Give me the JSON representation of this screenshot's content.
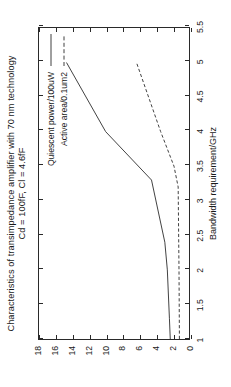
{
  "chart_data": {
    "type": "line",
    "title": "Characteristics of transimpedance amplifier with 70 nm technology",
    "subtitle": "Cd = 100fF, Cl = 4.6fF",
    "xlabel": "Bandwidth requirement/GHz",
    "ylabel": "",
    "xlim": [
      1,
      5.5
    ],
    "ylim": [
      0,
      18
    ],
    "xticks": [
      "1",
      "1.5",
      "2",
      "2.5",
      "3",
      "3.5",
      "4",
      "4.5",
      "5",
      "5.5"
    ],
    "xtick_values": [
      1,
      1.5,
      2,
      2.5,
      3,
      3.5,
      4,
      4.5,
      5,
      5.5
    ],
    "yticks": [
      "0",
      "2",
      "4",
      "6",
      "8",
      "10",
      "12",
      "14",
      "16",
      "18"
    ],
    "ytick_values": [
      0,
      2,
      4,
      6,
      8,
      10,
      12,
      14,
      16,
      18
    ],
    "grid": false,
    "legend_position": "top-right-inside",
    "series": [
      {
        "name": "Quiescent power/100uW",
        "style": "solid",
        "color": "#404040",
        "x": [
          1.0,
          1.3,
          2.0,
          2.4,
          3.3,
          4.0,
          5.0
        ],
        "y": [
          2.25,
          2.35,
          2.6,
          2.9,
          4.5,
          10.0,
          14.7
        ]
      },
      {
        "name": "Active area/0.1um2",
        "style": "dashed",
        "color": "#404040",
        "x": [
          1.0,
          2.0,
          3.2,
          3.5,
          4.0,
          5.0
        ],
        "y": [
          1.15,
          1.2,
          1.3,
          1.8,
          3.4,
          6.3
        ]
      }
    ]
  },
  "legend": {
    "entries": [
      {
        "label": "Quiescent power/100uW",
        "style": "solid"
      },
      {
        "label": "Active area/0.1um2",
        "style": "dashed"
      }
    ]
  },
  "axes": {
    "x_title": "Bandwidth requirement/GHz",
    "x_labels": [
      "1",
      "1.5",
      "2",
      "2.5",
      "3",
      "3.5",
      "4",
      "4.5",
      "5",
      "5.5"
    ],
    "y_labels": [
      "0",
      "2",
      "4",
      "6",
      "8",
      "10",
      "12",
      "14",
      "16",
      "18"
    ]
  },
  "title": {
    "line1": "Characteristics of transimpedance amplifier with 70 nm technology",
    "line2": "Cd = 100fF, Cl = 4.6fF"
  },
  "colors": {
    "line": "#404040",
    "axis": "#2a2a2a",
    "text": "#1a1a1a",
    "background": "#ffffff"
  }
}
